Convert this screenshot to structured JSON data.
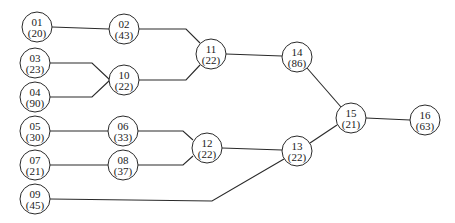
{
  "diagram": {
    "type": "tree-network",
    "node_radius": 15,
    "nodes": [
      {
        "id": "01",
        "value": "(20)",
        "x": 37,
        "y": 27
      },
      {
        "id": "02",
        "value": "(43)",
        "x": 124,
        "y": 29
      },
      {
        "id": "03",
        "value": "(23)",
        "x": 35,
        "y": 63
      },
      {
        "id": "04",
        "value": "(90)",
        "x": 35,
        "y": 97
      },
      {
        "id": "10",
        "value": "(22)",
        "x": 124,
        "y": 80
      },
      {
        "id": "11",
        "value": "(22)",
        "x": 211,
        "y": 54
      },
      {
        "id": "14",
        "value": "(86)",
        "x": 297,
        "y": 57
      },
      {
        "id": "05",
        "value": "(30)",
        "x": 35,
        "y": 131
      },
      {
        "id": "06",
        "value": "(33)",
        "x": 123,
        "y": 131
      },
      {
        "id": "07",
        "value": "(21)",
        "x": 35,
        "y": 165
      },
      {
        "id": "08",
        "value": "(37)",
        "x": 123,
        "y": 165
      },
      {
        "id": "09",
        "value": "(45)",
        "x": 35,
        "y": 199
      },
      {
        "id": "12",
        "value": "(22)",
        "x": 207,
        "y": 148
      },
      {
        "id": "13",
        "value": "(22)",
        "x": 297,
        "y": 151
      },
      {
        "id": "15",
        "value": "(21)",
        "x": 351,
        "y": 118
      },
      {
        "id": "16",
        "value": "(63)",
        "x": 425,
        "y": 120
      }
    ],
    "edges": [
      {
        "from": "01",
        "to": "02",
        "points": [
          [
            52,
            27
          ],
          [
            109,
            29
          ]
        ]
      },
      {
        "from": "02",
        "to": "11",
        "points": [
          [
            139,
            29
          ],
          [
            186,
            29
          ],
          [
            200,
            43
          ]
        ]
      },
      {
        "from": "03",
        "to": "10",
        "points": [
          [
            50,
            63
          ],
          [
            92,
            63
          ],
          [
            110,
            80
          ]
        ]
      },
      {
        "from": "04",
        "to": "10",
        "points": [
          [
            50,
            97
          ],
          [
            92,
            97
          ],
          [
            110,
            80
          ]
        ]
      },
      {
        "from": "10",
        "to": "11",
        "points": [
          [
            139,
            80
          ],
          [
            186,
            80
          ],
          [
            200,
            65
          ]
        ]
      },
      {
        "from": "11",
        "to": "14",
        "points": [
          [
            226,
            54
          ],
          [
            282,
            56
          ]
        ]
      },
      {
        "from": "14",
        "to": "15",
        "points": [
          [
            307,
            68
          ],
          [
            341,
            107
          ]
        ]
      },
      {
        "from": "05",
        "to": "06",
        "points": [
          [
            50,
            131
          ],
          [
            108,
            131
          ]
        ]
      },
      {
        "from": "06",
        "to": "12",
        "points": [
          [
            138,
            131
          ],
          [
            183,
            131
          ],
          [
            193,
            140
          ]
        ]
      },
      {
        "from": "07",
        "to": "08",
        "points": [
          [
            50,
            165
          ],
          [
            108,
            165
          ]
        ]
      },
      {
        "from": "08",
        "to": "12",
        "points": [
          [
            138,
            165
          ],
          [
            183,
            165
          ],
          [
            193,
            156
          ]
        ]
      },
      {
        "from": "12",
        "to": "13",
        "points": [
          [
            222,
            148
          ],
          [
            282,
            150
          ]
        ]
      },
      {
        "from": "09",
        "to": "13",
        "points": [
          [
            50,
            199
          ],
          [
            212,
            201
          ],
          [
            284,
            159
          ]
        ]
      },
      {
        "from": "13",
        "to": "15",
        "points": [
          [
            310,
            143
          ],
          [
            337,
            125
          ]
        ]
      },
      {
        "from": "15",
        "to": "16",
        "points": [
          [
            366,
            118
          ],
          [
            410,
            120
          ]
        ]
      }
    ]
  }
}
